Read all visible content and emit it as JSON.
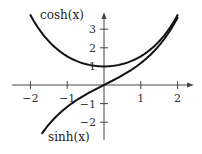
{
  "chart_data": {
    "type": "line",
    "title": "",
    "xlabel": "",
    "ylabel": "",
    "xlim": [
      -2.4,
      2.4
    ],
    "ylim": [
      -2.6,
      3.8
    ],
    "grid": false,
    "x_ticks": [
      {
        "value": -2,
        "label": "−2"
      },
      {
        "value": -1,
        "label": "−1"
      },
      {
        "value": 1,
        "label": "1"
      },
      {
        "value": 2,
        "label": "2"
      }
    ],
    "y_ticks": [
      {
        "value": 3,
        "label": "3"
      },
      {
        "value": 2,
        "label": "2"
      },
      {
        "value": 1,
        "label": "1"
      },
      {
        "value": -1,
        "label": "−1"
      },
      {
        "value": -2,
        "label": "−2"
      }
    ],
    "series": [
      {
        "name": "cosh(x)",
        "function": "cosh",
        "domain": [
          -2,
          2
        ],
        "label": "cosh(x)",
        "label_position": "top-left"
      },
      {
        "name": "sinh(x)",
        "function": "sinh",
        "domain": [
          -1.68,
          2
        ],
        "label": "sinh(x)",
        "label_position": "bottom-left"
      }
    ],
    "colors": {
      "axis": "#444444",
      "curve": "#111111",
      "text": "#222222"
    }
  }
}
